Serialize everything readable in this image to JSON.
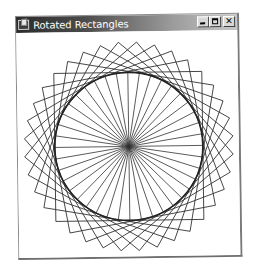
{
  "window": {
    "title": "Rotated Rectangles",
    "buttons": {
      "minimize": "minimize",
      "maximize": "maximize",
      "close": "✕"
    }
  },
  "drawing": {
    "center": [
      111,
      115
    ],
    "square_half_side": 74,
    "square_count": 9,
    "square_step_deg": 10,
    "circle_radius": 74,
    "spoke_count": 40,
    "stroke_color": "#333333",
    "circle_color": "#222222",
    "background": "#ffffff"
  }
}
